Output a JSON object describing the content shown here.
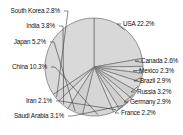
{
  "chart_data": {
    "type": "pie",
    "title": "",
    "legend_position": "none",
    "labels_position": "outside-with-leader-lines",
    "grid": false,
    "units": "percent",
    "categories": [
      "USA",
      "Canada",
      "Mexico",
      "Brazil",
      "Russia",
      "Germany",
      "France",
      "Saudi Arabia",
      "Iran",
      "China",
      "Japan",
      "India",
      "South Korea",
      "Other"
    ],
    "values": [
      22.2,
      2.6,
      2.3,
      2.9,
      3.2,
      2.9,
      2.2,
      3.1,
      2.1,
      10.3,
      5.2,
      3.8,
      2.8,
      34.4
    ],
    "slices": [
      {
        "name": "USA",
        "value": 22.2,
        "label": "USA 22.2%",
        "label_side": "right",
        "labeled": true,
        "color": "#d8d8d8"
      },
      {
        "name": "Canada",
        "value": 2.6,
        "label": "Canada 2.6%",
        "label_side": "right",
        "labeled": true,
        "color": "#d2d2d2"
      },
      {
        "name": "Mexico",
        "value": 2.3,
        "label": "Mexico 2.3%",
        "label_side": "right",
        "labeled": true,
        "color": "#dcdcdc"
      },
      {
        "name": "Brazil",
        "value": 2.9,
        "label": "Brazil 2.9%",
        "label_side": "right",
        "labeled": true,
        "color": "#d0d0d0"
      },
      {
        "name": "Russia",
        "value": 3.2,
        "label": "Russia 3.2%",
        "label_side": "right",
        "labeled": true,
        "color": "#dadada"
      },
      {
        "name": "Germany",
        "value": 2.9,
        "label": "Germany 2.9%",
        "label_side": "right",
        "labeled": true,
        "color": "#cecece"
      },
      {
        "name": "France",
        "value": 2.2,
        "label": "France 2.2%",
        "label_side": "right",
        "labeled": true,
        "color": "#d8d8d8"
      },
      {
        "name": "Saudi Arabia",
        "value": 3.1,
        "label": "Saudi Arabia 3.1%",
        "label_side": "left",
        "labeled": true,
        "color": "#cfcfcf"
      },
      {
        "name": "Iran",
        "value": 2.1,
        "label": "Iran 2.1%",
        "label_side": "left",
        "labeled": true,
        "color": "#dbdbdb"
      },
      {
        "name": "China",
        "value": 10.3,
        "label": "China 10.3%",
        "label_side": "left",
        "labeled": true,
        "color": "#d6d6d6"
      },
      {
        "name": "Japan",
        "value": 5.2,
        "label": "Japan 5.2%",
        "label_side": "left",
        "labeled": true,
        "color": "#d0d0d0"
      },
      {
        "name": "India",
        "value": 3.8,
        "label": "India 3.8%",
        "label_side": "left",
        "labeled": true,
        "color": "#dadada"
      },
      {
        "name": "South Korea",
        "value": 2.8,
        "label": "South Korea 2.8%",
        "label_side": "left",
        "labeled": true,
        "color": "#d2d2d2"
      },
      {
        "name": "Other",
        "value": 34.4,
        "label": "",
        "label_side": "none",
        "labeled": false,
        "color": "#d9d9d9"
      }
    ],
    "style": {
      "background": "#ffffff",
      "slice_fill": "#d6d6d6",
      "slice_border": "#6e6e6e",
      "leader_line": "#3a3a3a",
      "label_color": "#111111"
    }
  },
  "labels": {
    "usa": "USA 22.2%",
    "canada": "Canada 2.6%",
    "mexico": "Mexico 2.3%",
    "brazil": "Brazil 2.9%",
    "russia": "Russia 3.2%",
    "germany": "Germany 2.9%",
    "france": "France 2.2%",
    "saudi_arabia": "Saudi Arabia 3.1%",
    "iran": "Iran 2.1%",
    "china": "China 10.3%",
    "japan": "Japan 5.2%",
    "india": "India 3.8%",
    "south_korea": "South Korea 2.8%"
  }
}
